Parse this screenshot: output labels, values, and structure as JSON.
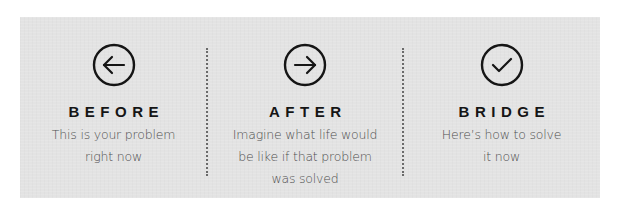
{
  "colors": {
    "panel_background": "#e3e3e3",
    "heading": "#151515",
    "body_text": "#4f4f4f",
    "icon_stroke": "#151515",
    "divider": "#6a6a6a"
  },
  "steps": [
    {
      "icon": "arrow-left-circle-icon",
      "heading": "BEFORE",
      "lines": [
        "This is your problem",
        "right now"
      ]
    },
    {
      "icon": "arrow-right-circle-icon",
      "heading": "AFTER",
      "lines": [
        "Imagine what life would",
        "be like if that problem",
        "was solved"
      ]
    },
    {
      "icon": "check-circle-icon",
      "heading": "BRIDGE",
      "lines": [
        "Here’s how to solve",
        "it now"
      ]
    }
  ]
}
